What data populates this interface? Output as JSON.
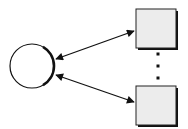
{
  "diagram": {
    "background": "#ffffff",
    "stroke_color": "#111111",
    "box_fill": "#ececec",
    "circle_fill": "#ffffff",
    "nodes": [
      {
        "id": "hub",
        "shape": "circle",
        "cx": 32,
        "cy": 66,
        "r": 22
      },
      {
        "id": "box-top",
        "shape": "rect",
        "x": 136,
        "y": 9,
        "w": 40,
        "h": 39
      },
      {
        "id": "box-bottom",
        "shape": "rect",
        "x": 136,
        "y": 86,
        "w": 40,
        "h": 39
      }
    ],
    "edges": [
      {
        "from": "hub",
        "to": "box-top",
        "x1": 56,
        "y1": 59,
        "x2": 134,
        "y2": 31,
        "direction": "both"
      },
      {
        "from": "hub",
        "to": "box-bottom",
        "x1": 56,
        "y1": 75,
        "x2": 134,
        "y2": 102,
        "direction": "both"
      }
    ],
    "ellipsis_dots": [
      {
        "cx": 158,
        "cy": 54
      },
      {
        "cx": 158,
        "cy": 66
      },
      {
        "cx": 158,
        "cy": 78
      }
    ]
  }
}
